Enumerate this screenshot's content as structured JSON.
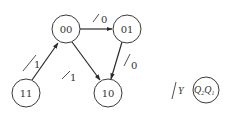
{
  "diagram": {
    "type": "state-transition",
    "states": [
      {
        "id": "s00",
        "label": "00"
      },
      {
        "id": "s01",
        "label": "01"
      },
      {
        "id": "s10",
        "label": "10"
      },
      {
        "id": "s11",
        "label": "11"
      }
    ],
    "transitions": [
      {
        "from": "00",
        "to": "01",
        "label": "0"
      },
      {
        "from": "01",
        "to": "10",
        "label": "0"
      },
      {
        "from": "00",
        "to": "10",
        "label": "1"
      },
      {
        "from": "11",
        "to": "00",
        "label": "1"
      }
    ],
    "legend": {
      "output_label": "Y",
      "state_var_1": "Q",
      "state_sub_1": "2",
      "state_var_2": "Q",
      "state_sub_2": "1"
    },
    "colors": {
      "stroke": "#2a2a2a",
      "background": "#ffffff"
    }
  }
}
